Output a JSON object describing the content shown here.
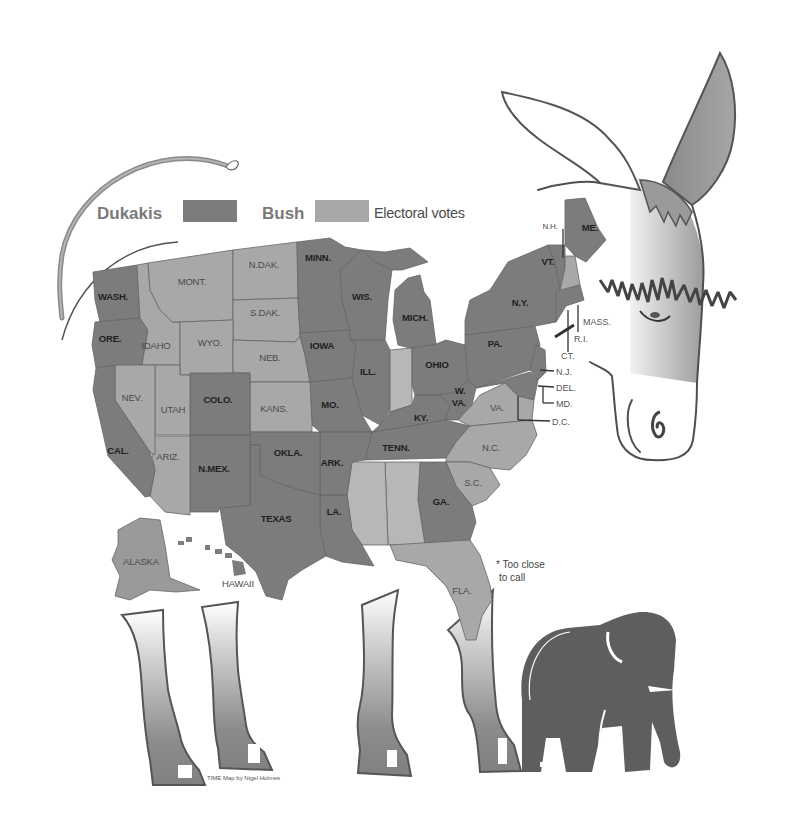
{
  "legend": {
    "dukakis_label": "Dukakis",
    "bush_label": "Bush",
    "electoral_votes_label": "Electoral votes",
    "dukakis_color": "#7c7c7c",
    "bush_color": "#a8a8a8"
  },
  "map": {
    "states": [
      {
        "label": "WASH.",
        "party": "dukakis"
      },
      {
        "label": "ORE.",
        "party": "dukakis"
      },
      {
        "label": "IDAHO",
        "party": "bush"
      },
      {
        "label": "MONT.",
        "party": "bush"
      },
      {
        "label": "N.DAK.",
        "party": "bush"
      },
      {
        "label": "S.DAK.",
        "party": "bush"
      },
      {
        "label": "WYO.",
        "party": "bush"
      },
      {
        "label": "NEB.",
        "party": "bush"
      },
      {
        "label": "MINN.",
        "party": "dukakis"
      },
      {
        "label": "IOWA",
        "party": "dukakis"
      },
      {
        "label": "WIS.",
        "party": "dukakis"
      },
      {
        "label": "MICH.",
        "party": "dukakis"
      },
      {
        "label": "ILL.",
        "party": "dukakis"
      },
      {
        "label": "OHIO",
        "party": "dukakis"
      },
      {
        "label": "PA.",
        "party": "dukakis"
      },
      {
        "label": "N.Y.",
        "party": "dukakis"
      },
      {
        "label": "W.",
        "label2": "VA.",
        "party": "dukakis"
      },
      {
        "label": "VA.",
        "party": "bush"
      },
      {
        "label": "KY.",
        "party": "dukakis"
      },
      {
        "label": "TENN.",
        "party": "dukakis"
      },
      {
        "label": "N.C.",
        "party": "bush"
      },
      {
        "label": "S.C.",
        "party": "bush"
      },
      {
        "label": "GA.",
        "party": "dukakis"
      },
      {
        "label": "FLA.",
        "party": "bush"
      },
      {
        "label": "LA.",
        "party": "dukakis"
      },
      {
        "label": "ARK.",
        "party": "dukakis"
      },
      {
        "label": "MO.",
        "party": "dukakis"
      },
      {
        "label": "KANS.",
        "party": "bush"
      },
      {
        "label": "OKLA.",
        "party": "dukakis"
      },
      {
        "label": "TEXAS",
        "party": "dukakis"
      },
      {
        "label": "N.MEX.",
        "party": "dukakis"
      },
      {
        "label": "COLO.",
        "party": "dukakis"
      },
      {
        "label": "UTAH",
        "party": "bush"
      },
      {
        "label": "ARIZ.",
        "party": "bush"
      },
      {
        "label": "NEV.",
        "party": "bush"
      },
      {
        "label": "CAL.",
        "party": "dukakis"
      },
      {
        "label": "ALASKA",
        "party": "bush"
      },
      {
        "label": "HAWAII",
        "party": "dukakis"
      },
      {
        "label": "ME.",
        "party": "dukakis"
      },
      {
        "label": "VT.",
        "party": "dukakis"
      },
      {
        "label": "N.H.",
        "party": "bush"
      }
    ],
    "unlabeled_states": [
      {
        "name": "IND",
        "party": "too close"
      },
      {
        "name": "MISS",
        "party": "too close"
      },
      {
        "name": "ALA",
        "party": "too close"
      }
    ],
    "small_state_callouts": [
      "MASS.",
      "R.I.",
      "CT.",
      "N.J.",
      "DEL.",
      "MD.",
      "D.C."
    ]
  },
  "footnote": {
    "line1": "* Too close",
    "line2": "to call"
  },
  "credit": "TIME Map by Nigel Holmes",
  "illustration": {
    "body": "donkey",
    "second_figure": "elephant"
  }
}
